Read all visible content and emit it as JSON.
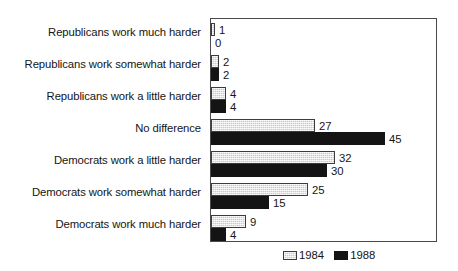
{
  "chart_data": {
    "type": "bar",
    "orientation": "horizontal",
    "title": "",
    "subtitle": "",
    "xlabel": "",
    "ylabel": "",
    "xlim": [
      0,
      58
    ],
    "grid": false,
    "legend_position": "bottom-right",
    "categories": [
      "Republicans work much harder",
      "Republicans work somewhat harder",
      "Republicans work a little harder",
      "No difference",
      "Democrats work a little harder",
      "Democrats work somewhat harder",
      "Democrats work much harder"
    ],
    "series": [
      {
        "name": "1984",
        "color": "#c9c9c9",
        "values": [
          1,
          2,
          4,
          27,
          32,
          25,
          9
        ]
      },
      {
        "name": "1988",
        "color": "#141414",
        "values": [
          0,
          2,
          4,
          45,
          30,
          15,
          4
        ]
      }
    ],
    "legend": [
      "1984",
      "1988"
    ],
    "data_labels": [
      [
        "1",
        "2",
        "4",
        "27",
        "32",
        "25",
        "9"
      ],
      [
        "0",
        "2",
        "4",
        "45",
        "30",
        "15",
        "4"
      ]
    ]
  }
}
